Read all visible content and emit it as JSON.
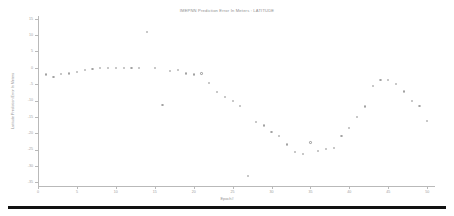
{
  "chart_data": {
    "type": "scatter",
    "title": "IMEPNN Prediction Error In Meters : LATITUDE",
    "xlabel": "Epoch#",
    "ylabel": "Latitude Prediction Error In Meters",
    "xlim": [
      0,
      51
    ],
    "ylim": [
      -36,
      16
    ],
    "grid": false,
    "legend": null,
    "xticks": [
      0,
      5,
      10,
      15,
      20,
      25,
      30,
      35,
      40,
      45,
      50
    ],
    "xtick_labels": [
      "0",
      "5",
      "10",
      "15",
      "20",
      "25",
      "30",
      "35",
      "40",
      "45",
      "50"
    ],
    "yticks": [
      15,
      10,
      5,
      0,
      -5,
      -10,
      -15,
      -20,
      -25,
      -30,
      -35
    ],
    "ytick_labels": [
      "15",
      "10",
      "5",
      "0",
      "-5",
      "-10",
      "-15",
      "-20",
      "-25",
      "-30",
      "-35"
    ],
    "series": [
      {
        "name": "Latitude Prediction Error",
        "marker": "circle",
        "color": "#a2a2a2",
        "x": [
          1,
          2,
          3,
          4,
          5,
          6,
          7,
          8,
          9,
          10,
          11,
          12,
          13,
          14,
          15,
          16,
          17,
          18,
          19,
          20,
          21,
          22,
          23,
          24,
          25,
          26,
          27,
          28,
          29,
          30,
          31,
          32,
          33,
          34,
          35,
          36,
          37,
          38,
          39,
          40,
          41,
          42,
          43,
          44,
          45,
          46,
          47,
          48,
          49,
          50
        ],
        "y": [
          -1.9,
          -2.6,
          -1.8,
          -1.6,
          -1.2,
          -0.4,
          -0.2,
          0.0,
          0.0,
          0.1,
          0.1,
          0.0,
          0.0,
          11.0,
          0.0,
          -11.3,
          -0.8,
          -0.6,
          -1.6,
          -1.9,
          -1.6,
          -4.6,
          -7.3,
          -8.8,
          -10.0,
          -11.5,
          -33.0,
          -16.3,
          -17.5,
          -19.4,
          -20.6,
          -23.3,
          -25.6,
          -26.1,
          -22.7,
          -25.4,
          -24.8,
          -24.3,
          -20.8,
          -18.2,
          -15.0,
          -11.7,
          -5.5,
          -3.7,
          -3.6,
          -4.7,
          -7.1,
          -10.1,
          -11.5,
          -16.2
        ]
      }
    ]
  }
}
